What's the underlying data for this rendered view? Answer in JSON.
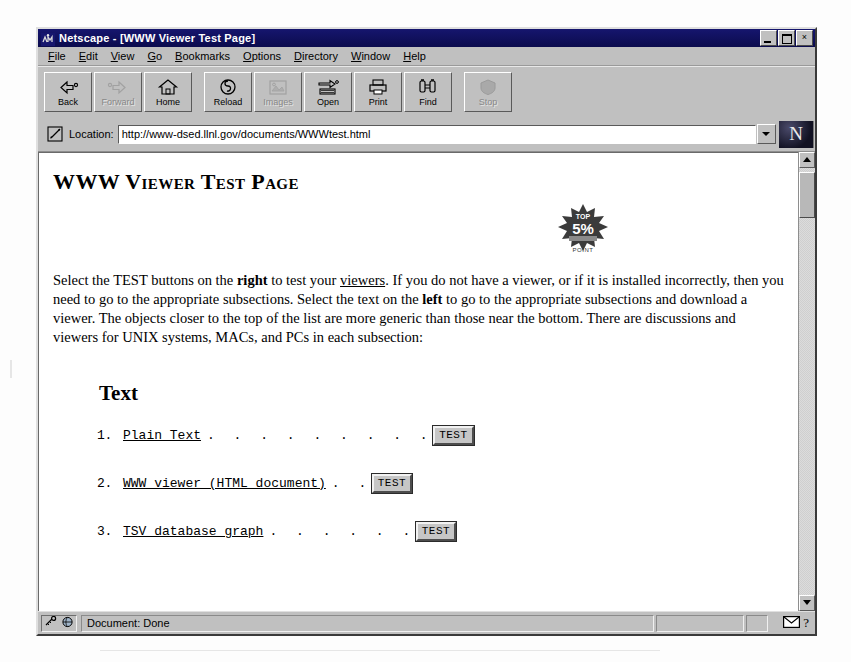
{
  "window": {
    "title": "Netscape - [WWW Viewer Test Page]",
    "app_icon": "netscape-icon",
    "controls": {
      "minimize": "minimize-icon",
      "restore": "restore-icon",
      "close": "×"
    }
  },
  "menubar": {
    "items": [
      {
        "label": "File",
        "accel": "F"
      },
      {
        "label": "Edit",
        "accel": "E"
      },
      {
        "label": "View",
        "accel": "V"
      },
      {
        "label": "Go",
        "accel": "G"
      },
      {
        "label": "Bookmarks",
        "accel": "B"
      },
      {
        "label": "Options",
        "accel": "O"
      },
      {
        "label": "Directory",
        "accel": "D"
      },
      {
        "label": "Window",
        "accel": "W"
      },
      {
        "label": "Help",
        "accel": "H"
      }
    ]
  },
  "toolbar": {
    "buttons": [
      {
        "label": "Back",
        "icon": "back-arrow-icon",
        "enabled": true
      },
      {
        "label": "Forward",
        "icon": "forward-arrow-icon",
        "enabled": false
      },
      {
        "label": "Home",
        "icon": "home-icon",
        "enabled": true
      },
      {
        "label": "Reload",
        "icon": "reload-icon",
        "enabled": true
      },
      {
        "label": "Images",
        "icon": "images-icon",
        "enabled": false
      },
      {
        "label": "Open",
        "icon": "open-icon",
        "enabled": true
      },
      {
        "label": "Print",
        "icon": "printer-icon",
        "enabled": true
      },
      {
        "label": "Find",
        "icon": "binoculars-icon",
        "enabled": true
      },
      {
        "label": "Stop",
        "icon": "stop-icon",
        "enabled": false
      }
    ]
  },
  "location": {
    "icon": "bookmark-quill-icon",
    "label": "Location:",
    "value": "http://www-dsed.llnl.gov/documents/WWWtest.html",
    "placeholder": "",
    "dropdown_icon": "chevron-down-icon",
    "brand_logo": "N"
  },
  "document": {
    "title": "WWW Viewer Test Page",
    "badge": {
      "name": "top-5-percent-award-badge",
      "line1": "TOP",
      "line2": "5%",
      "caption": "POINT"
    },
    "intro": {
      "part1": "Select the TEST buttons on the ",
      "bold1": "right",
      "part2": " to test your ",
      "link1": "viewers",
      "part3": ". If you do not have a viewer, or if it is installed incorrectly, then you need to go to the appropriate subsections. Select the text on the ",
      "bold2": "left",
      "part4": " to go to the appropriate subsections and download a viewer. The objects closer to the top of the list are more generic than those near the bottom. There are discussions and viewers for UNIX systems, MACs, and PCs in each subsection:"
    },
    "section_title": "Text",
    "list": [
      {
        "num": "1.",
        "link": "Plain Text",
        "dots": ". . . . . . . . .",
        "button": "TEST"
      },
      {
        "num": "2.",
        "link": "WWW viewer (HTML document)",
        "dots": ". .",
        "button": "TEST"
      },
      {
        "num": "3.",
        "link": "TSV database graph",
        "dots": ". . . . . .",
        "button": "TEST"
      }
    ]
  },
  "scrollbar": {
    "up_icon": "scroll-up-arrow-icon",
    "down_icon": "scroll-down-arrow-icon"
  },
  "statusbar": {
    "security_icons": [
      "broken-key-icon",
      "globe-icon"
    ],
    "message": "Document: Done",
    "mail_icon": "mail-envelope-icon",
    "help_icon": "?"
  }
}
